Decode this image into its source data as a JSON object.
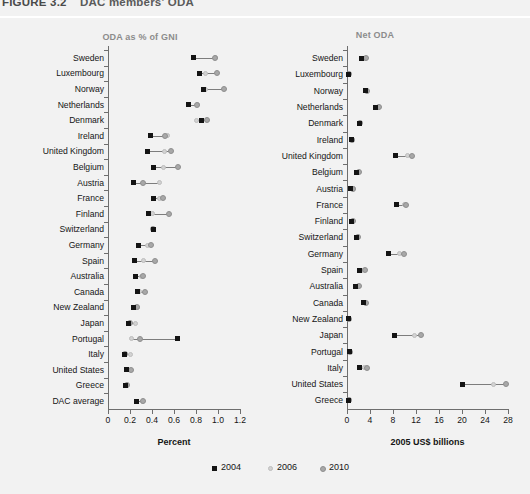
{
  "figure": {
    "number": "FIGURE 3.2",
    "title": "DAC members' ODA"
  },
  "legend": {
    "position": "bottom-center",
    "items": [
      {
        "label": "2004",
        "marker": "square-marker",
        "color": "#141414"
      },
      {
        "label": "2006",
        "marker": "circle-marker",
        "color": "#d2d2d2"
      },
      {
        "label": "2010",
        "marker": "circle-marker",
        "color": "#a8a8a8"
      }
    ]
  },
  "chart_data": [
    {
      "id": "oda-percent-gni",
      "type": "scatter",
      "title": "ODA as % of GNI",
      "xlabel": "Percent",
      "ylabel": "",
      "xlim": [
        0,
        1.2
      ],
      "xticks": [
        0,
        0.2,
        0.4,
        0.6,
        0.8,
        1.0,
        1.2
      ],
      "xtick_labels": [
        "0",
        "0.2",
        "0.4",
        "0.6",
        "0.8",
        "1.0",
        "1.2"
      ],
      "grid": false,
      "categories": [
        "Sweden",
        "Luxembourg",
        "Norway",
        "Netherlands",
        "Denmark",
        "Ireland",
        "United Kingdom",
        "Belgium",
        "Austria",
        "France",
        "Finland",
        "Switzerland",
        "Germany",
        "Spain",
        "Australia",
        "Canada",
        "New Zealand",
        "Japan",
        "Portugal",
        "Italy",
        "United States",
        "Greece",
        "DAC average"
      ],
      "series": [
        {
          "name": "2004",
          "values": [
            0.78,
            0.83,
            0.87,
            0.73,
            0.85,
            0.39,
            0.36,
            0.41,
            0.23,
            0.41,
            0.37,
            0.41,
            0.28,
            0.24,
            0.25,
            0.27,
            0.23,
            0.19,
            0.63,
            0.15,
            0.17,
            0.16,
            0.26
          ]
        },
        {
          "name": "2006",
          "values": [
            0.98,
            0.89,
            0.89,
            0.81,
            0.8,
            0.54,
            0.51,
            0.5,
            0.47,
            0.47,
            0.4,
            0.41,
            0.36,
            0.32,
            0.3,
            0.29,
            0.27,
            0.25,
            0.21,
            0.2,
            0.18,
            0.17,
            0.31
          ]
        },
        {
          "name": "2010",
          "values": [
            0.97,
            0.99,
            1.05,
            0.81,
            0.9,
            0.52,
            0.57,
            0.64,
            0.32,
            0.5,
            0.55,
            0.41,
            0.39,
            0.43,
            0.32,
            0.34,
            0.26,
            0.2,
            0.29,
            0.15,
            0.21,
            0.17,
            0.32
          ]
        }
      ]
    },
    {
      "id": "net-oda",
      "type": "scatter",
      "title": "Net ODA",
      "xlabel": "2005 US$ billions",
      "ylabel": "",
      "xlim": [
        0,
        28
      ],
      "xticks": [
        0,
        4,
        8,
        12,
        16,
        20,
        24,
        28
      ],
      "xtick_labels": [
        "0",
        "4",
        "8",
        "12",
        "16",
        "20",
        "24",
        "28"
      ],
      "grid": false,
      "categories": [
        "Sweden",
        "Luxembourg",
        "Norway",
        "Netherlands",
        "Denmark",
        "Ireland",
        "United Kingdom",
        "Belgium",
        "Austria",
        "France",
        "Finland",
        "Switzerland",
        "Germany",
        "Spain",
        "Australia",
        "Canada",
        "New Zealand",
        "Japan",
        "Portugal",
        "Italy",
        "United States",
        "Greece"
      ],
      "series": [
        {
          "name": "2004",
          "values": [
            2.5,
            0.3,
            3.2,
            4.9,
            2.2,
            0.8,
            8.4,
            1.7,
            0.6,
            8.6,
            0.8,
            1.7,
            7.3,
            2.1,
            1.5,
            2.9,
            0.2,
            8.3,
            0.5,
            2.2,
            20.1,
            0.3
          ]
        },
        {
          "name": "2006",
          "values": [
            3.0,
            0.3,
            3.2,
            5.4,
            2.2,
            0.9,
            10.6,
            2.0,
            1.1,
            10.0,
            0.9,
            1.7,
            9.2,
            2.6,
            1.8,
            3.1,
            0.3,
            11.7,
            0.5,
            3.0,
            25.5,
            0.4
          ]
        },
        {
          "name": "2010",
          "values": [
            3.3,
            0.4,
            3.4,
            5.6,
            2.3,
            0.9,
            11.3,
            2.1,
            1.0,
            10.2,
            1.0,
            1.9,
            9.9,
            3.1,
            2.0,
            3.3,
            0.3,
            12.9,
            0.6,
            3.5,
            27.6,
            0.4
          ]
        }
      ]
    }
  ]
}
